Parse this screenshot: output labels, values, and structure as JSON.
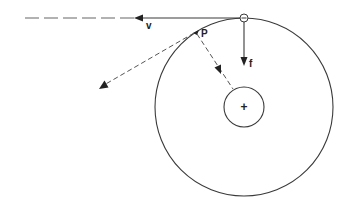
{
  "diagram": {
    "labels": {
      "velocity": "v",
      "force": "f",
      "point": "P",
      "orbiting_charge": "−",
      "nucleus_charge": "+"
    },
    "colors": {
      "stroke": "#3a3a3a",
      "dashed": "#555555",
      "background": "#ffffff"
    },
    "geometry": {
      "orbit_circle": {
        "cx": 244,
        "cy": 107,
        "r": 89
      },
      "nucleus_circle": {
        "cx": 244,
        "cy": 107,
        "r": 20
      },
      "electron_circle": {
        "cx": 244,
        "cy": 18,
        "r": 4
      },
      "point_p": {
        "x": 196,
        "y": 32
      }
    }
  }
}
